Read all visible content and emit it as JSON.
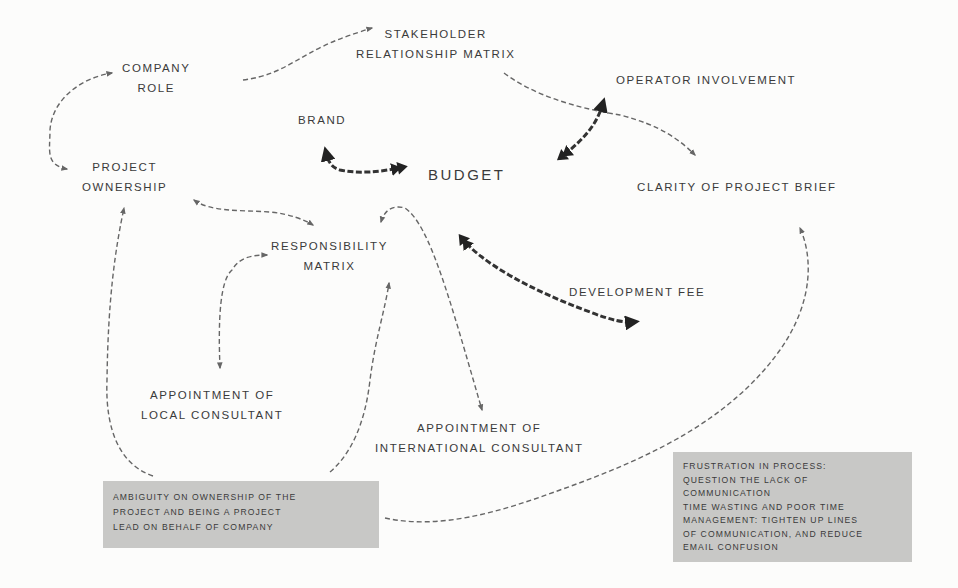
{
  "diagram": {
    "type": "concept-map",
    "colors": {
      "background": "#fcfcfb",
      "text": "#3a3a3a",
      "edge": "#666666",
      "strong_edge": "#333333",
      "note_background": "#c8c8c6"
    },
    "nodes": {
      "company_role": {
        "lines": [
          "COMPANY",
          "ROLE"
        ]
      },
      "stakeholder_matrix": {
        "lines": [
          "STAKEHOLDER",
          "RELATIONSHIP MATRIX"
        ]
      },
      "operator_involvement": {
        "lines": [
          "OPERATOR INVOLVEMENT"
        ]
      },
      "brand": {
        "lines": [
          "BRAND"
        ]
      },
      "budget": {
        "lines": [
          "BUDGET"
        ]
      },
      "project_ownership": {
        "lines": [
          "PROJECT",
          "OWNERSHIP"
        ]
      },
      "clarity_brief": {
        "lines": [
          "CLARITY OF PROJECT BRIEF"
        ]
      },
      "responsibility_matrix": {
        "lines": [
          "RESPONSIBILITY",
          "MATRIX"
        ]
      },
      "development_fee": {
        "lines": [
          "DEVELOPMENT FEE"
        ]
      },
      "local_consultant": {
        "lines": [
          "APPOINTMENT OF",
          "LOCAL CONSULTANT"
        ]
      },
      "international_consultant": {
        "lines": [
          "APPOINTMENT OF",
          "INTERNATIONAL CONSULTANT"
        ]
      }
    },
    "notes": {
      "ambiguity": {
        "lines": [
          "AMBIGUITY ON OWNERSHIP OF THE",
          "PROJECT AND BEING A PROJECT",
          "LEAD ON BEHALF OF COMPANY"
        ]
      },
      "frustration": {
        "lines": [
          "FRUSTRATION IN PROCESS:",
          "QUESTION THE LACK OF",
          "COMMUNICATION",
          "TIME WASTING AND POOR TIME",
          "MANAGEMENT: TIGHTEN UP LINES",
          "OF COMMUNICATION, AND REDUCE",
          "EMAIL CONFUSION"
        ]
      }
    },
    "edges": [
      {
        "from": "company_role",
        "to": "stakeholder_matrix",
        "style": "dashed"
      },
      {
        "from": "project_ownership",
        "to": "company_role",
        "style": "dashed",
        "bidirectional": true
      },
      {
        "from": "stakeholder_matrix",
        "to": "clarity_brief",
        "style": "dashed"
      },
      {
        "from": "operator_involvement",
        "to": "budget",
        "style": "bold-dashed",
        "bidirectional": true
      },
      {
        "from": "budget",
        "to": "brand",
        "style": "bold-dashed"
      },
      {
        "from": "budget",
        "to": "development_fee",
        "style": "bold-dashed",
        "bidirectional": true
      },
      {
        "from": "project_ownership",
        "to": "responsibility_matrix",
        "style": "dashed",
        "bidirectional": true
      },
      {
        "from": "local_consultant",
        "to": "responsibility_matrix",
        "style": "dashed",
        "bidirectional": true
      },
      {
        "from": "international_consultant",
        "to": "responsibility_matrix",
        "style": "dashed",
        "bidirectional": true
      },
      {
        "from": "ambiguity",
        "to": "project_ownership",
        "style": "dashed"
      },
      {
        "from": "ambiguity",
        "to": "responsibility_matrix",
        "style": "dashed"
      },
      {
        "from": "ambiguity",
        "to": "clarity_brief",
        "style": "dashed"
      }
    ]
  }
}
